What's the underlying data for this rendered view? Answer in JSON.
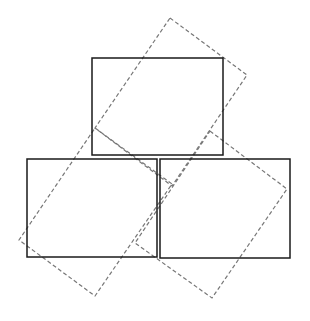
{
  "diagram": {
    "width": 310,
    "height": 321,
    "stroke_solid": "#1a1a1a",
    "stroke_dashed": "#777777",
    "solid_rects": [
      {
        "name": "top-box",
        "x": 92,
        "y": 58,
        "w": 131,
        "h": 97
      },
      {
        "name": "bottom-left-box",
        "x": 27,
        "y": 159,
        "w": 130,
        "h": 98
      },
      {
        "name": "bottom-right-box",
        "x": 160,
        "y": 159,
        "w": 130,
        "h": 99
      }
    ],
    "dashed_rects": [
      {
        "name": "top-rotated-box",
        "points": "170,18 247,75 172,186 95,128"
      },
      {
        "name": "left-rotated-box",
        "points": "95,128 172,184 95,296 19,240"
      },
      {
        "name": "right-rotated-box",
        "points": "210,131 287,189 212,298 135,243"
      }
    ]
  }
}
